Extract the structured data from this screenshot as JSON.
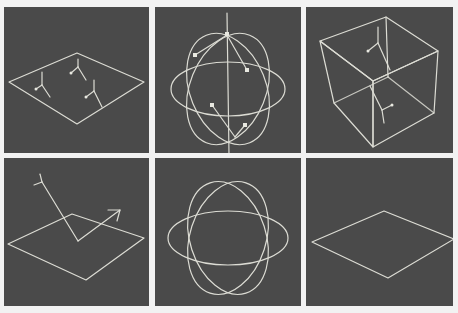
{
  "figure": {
    "layout": "2x3 grid",
    "background_color": "#f2f2f2",
    "panel_color": "#4a4a4a",
    "line_color": "#dcdcd4",
    "panels": [
      {
        "id": "plane-with-normals",
        "description": "Diamond plane with three small surface-normal glyphs"
      },
      {
        "id": "sphere-with-arrows",
        "description": "Three intersecting ellipses forming a sphere with axis line and arrows"
      },
      {
        "id": "cube-with-normals",
        "description": "Wireframe cube with normal glyphs on faces"
      },
      {
        "id": "plane-reflection",
        "description": "Diamond plane with incident ray and reflected arrow"
      },
      {
        "id": "sphere-wireframe",
        "description": "Three intersecting ellipses forming a sphere"
      },
      {
        "id": "plane-plain",
        "description": "Plain diamond plane outline"
      }
    ]
  }
}
